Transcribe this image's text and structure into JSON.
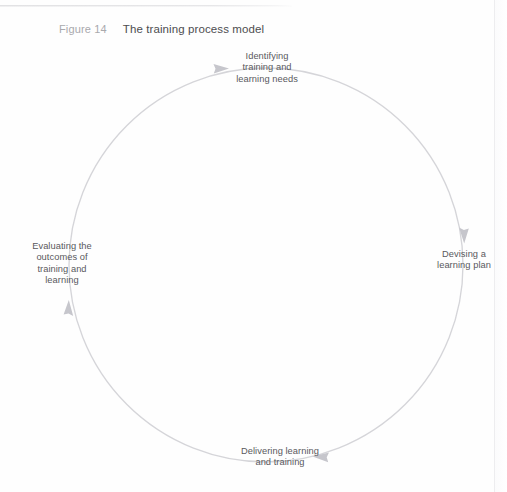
{
  "page": {
    "background_color": "#fefefe",
    "rule_color": "#e4e4e6",
    "edge_line_color": "#ededef"
  },
  "caption": {
    "figure_number": "Figure 14",
    "title": "The training process model",
    "figure_number_color": "#a9a9ad",
    "title_color": "#4d4d50"
  },
  "diagram": {
    "type": "cycle",
    "direction": "clockwise",
    "circle": {
      "center_x": 266,
      "center_y": 265,
      "radius": 197,
      "stroke_color": "#d5d5d9",
      "stroke_width": 1.3
    },
    "label_color": "#59595d",
    "arrow_color": "#c9c9cf",
    "nodes": [
      {
        "id": "identifying-needs",
        "position": "top",
        "lines": [
          "Identifying",
          "training and",
          "learning needs"
        ]
      },
      {
        "id": "devising-plan",
        "position": "right",
        "lines": [
          "Devising a",
          "learning plan"
        ]
      },
      {
        "id": "delivering-training",
        "position": "bottom",
        "lines": [
          "Delivering learning",
          "and training"
        ]
      },
      {
        "id": "evaluating-outcomes",
        "position": "left",
        "lines": [
          "Evaluating the",
          "outcomes of",
          "training and",
          "learning"
        ]
      }
    ],
    "arrows": [
      {
        "id": "arrow-to-identifying",
        "at": "top",
        "points": "right"
      },
      {
        "id": "arrow-to-devising",
        "at": "right",
        "points": "down"
      },
      {
        "id": "arrow-to-delivering",
        "at": "bottom",
        "points": "left"
      },
      {
        "id": "arrow-to-evaluating",
        "at": "left",
        "points": "up"
      }
    ]
  }
}
